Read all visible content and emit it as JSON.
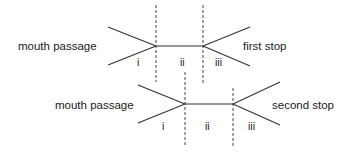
{
  "diagrams": [
    {
      "id": "first",
      "left_label": "mouth passage",
      "right_label": "first stop",
      "zones": [
        "i",
        "ii",
        "iii"
      ]
    },
    {
      "id": "second",
      "left_label": "mouth passage",
      "right_label": "second stop",
      "zones": [
        "i",
        "ii",
        "iii"
      ]
    }
  ],
  "colors": {
    "line": "#333333",
    "dash": "#444444",
    "text": "#1a1a1a",
    "background": "#ffffff"
  }
}
